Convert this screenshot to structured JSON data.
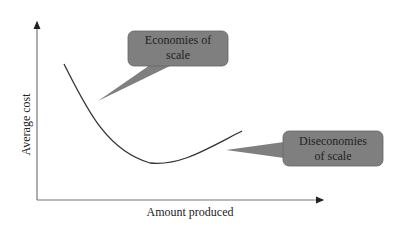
{
  "diagram": {
    "y_axis_label": "Average cost",
    "x_axis_label": "Amount produced",
    "callouts": [
      {
        "line1": "Economies of",
        "line2": "scale"
      },
      {
        "line1": "Diseconomies",
        "line2": "of scale"
      }
    ],
    "colors": {
      "callout_fill": "#7f7f7f",
      "curve": "#333333",
      "axis": "#666666"
    }
  }
}
